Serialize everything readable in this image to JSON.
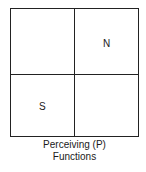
{
  "diagram": {
    "quadrants": [
      {
        "position": "top-left",
        "label": ""
      },
      {
        "position": "top-right",
        "label": "N"
      },
      {
        "position": "bottom-left",
        "label": "S"
      },
      {
        "position": "bottom-right",
        "label": ""
      }
    ],
    "caption": {
      "line1": "Perceiving (P)",
      "line2": "Functions"
    }
  }
}
